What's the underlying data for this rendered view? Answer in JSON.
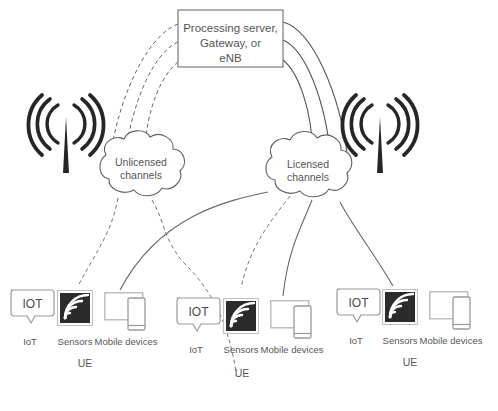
{
  "diagram": {
    "server": {
      "name": "processing-server-box",
      "line1": "Processing server,",
      "line2": "Gateway, or",
      "line3": "eNB"
    },
    "clouds": [
      {
        "name": "unlicensed-channels-cloud",
        "line1": "Unlicensed",
        "line2": "channels"
      },
      {
        "name": "licensed-channels-cloud",
        "line1": "Licensed",
        "line2": "channels"
      }
    ],
    "towers": [
      {
        "name": "antenna-tower-left"
      },
      {
        "name": "antenna-tower-right"
      }
    ],
    "device_groups": [
      {
        "name": "ue-group-left",
        "group_label": "UE",
        "devices": [
          {
            "name": "iot-device",
            "icon": "iot-bubble-icon",
            "badge": "IOT",
            "label": "IoT"
          },
          {
            "name": "sensors-device",
            "icon": "sensors-wifi-icon",
            "label": "Sensors"
          },
          {
            "name": "mobile-device",
            "icon": "tablet-phone-icon",
            "label": "Mobile devices"
          }
        ]
      },
      {
        "name": "ue-group-center",
        "group_label": "UE",
        "devices": [
          {
            "name": "iot-device",
            "icon": "iot-bubble-icon",
            "badge": "IOT",
            "label": "IoT"
          },
          {
            "name": "sensors-device",
            "icon": "sensors-wifi-icon",
            "label": "Sensors"
          },
          {
            "name": "mobile-device",
            "icon": "tablet-phone-icon",
            "label": "Mobile devices"
          }
        ]
      },
      {
        "name": "ue-group-right",
        "group_label": "UE",
        "devices": [
          {
            "name": "iot-device",
            "icon": "iot-bubble-icon",
            "badge": "IOT",
            "label": "IoT"
          },
          {
            "name": "sensors-device",
            "icon": "sensors-wifi-icon",
            "label": "Sensors"
          },
          {
            "name": "mobile-device",
            "icon": "tablet-phone-icon",
            "label": "Mobile devices"
          }
        ]
      }
    ],
    "colors": {
      "stroke": "#555555",
      "text": "#555555",
      "background": "#ffffff",
      "sensor_fill": "#2b2b2b",
      "tower_fill": "#262626",
      "device_outline": "#b5b5b5"
    },
    "link_styles": {
      "unlicensed": "dashed",
      "licensed": "solid"
    }
  }
}
